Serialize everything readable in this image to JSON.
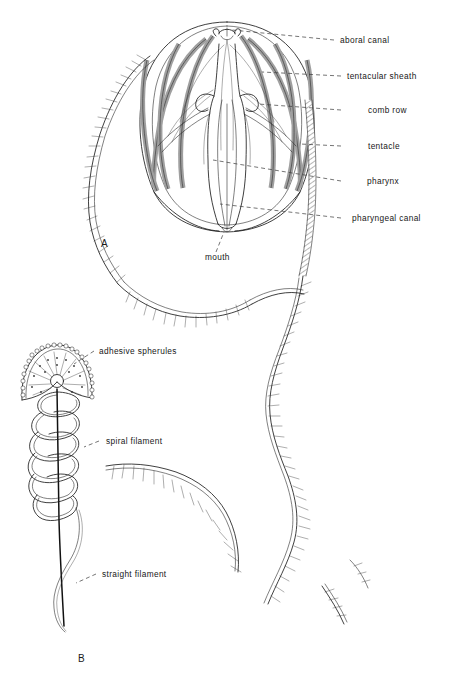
{
  "figure": {
    "background_color": "#ffffff",
    "ink_color": "#1d1d1d"
  },
  "panels": [
    {
      "id": "A",
      "label": "A",
      "caption_x": 101,
      "caption_y": 247
    },
    {
      "id": "B",
      "label": "B",
      "caption_x": 78,
      "caption_y": 662
    }
  ],
  "labels_panel_a": [
    {
      "name": "aboral-canal",
      "text": "aboral canal",
      "x": 340,
      "y": 43,
      "leader_from_x": 334,
      "leader_from_y": 40,
      "leader_to_x": 232,
      "leader_to_y": 30
    },
    {
      "name": "tentacular-sheath",
      "text": "tentacular sheath",
      "x": 347,
      "y": 79,
      "leader_from_x": 341,
      "leader_from_y": 76,
      "leader_to_x": 262,
      "leader_to_y": 72
    },
    {
      "name": "comb-row",
      "text": "comb row",
      "x": 368,
      "y": 113,
      "leader_from_x": 341,
      "leader_from_y": 110,
      "leader_to_x": 258,
      "leader_to_y": 104
    },
    {
      "name": "tentacle",
      "text": "tentacle",
      "x": 368,
      "y": 149,
      "leader_from_x": 341,
      "leader_from_y": 146,
      "leader_to_x": 300,
      "leader_to_y": 144
    },
    {
      "name": "pharynx",
      "text": "pharynx",
      "x": 367,
      "y": 184,
      "leader_from_x": 341,
      "leader_from_y": 181,
      "leader_to_x": 213,
      "leader_to_y": 160
    },
    {
      "name": "pharyngeal-canal",
      "text": "pharyngeal canal",
      "x": 352,
      "y": 221,
      "leader_from_x": 341,
      "leader_from_y": 218,
      "leader_to_x": 220,
      "leader_to_y": 204
    },
    {
      "name": "mouth",
      "text": "mouth",
      "x": 205,
      "y": 260,
      "leader_from_x": 216,
      "leader_from_y": 252,
      "leader_to_x": 224,
      "leader_to_y": 232
    }
  ],
  "labels_panel_b": [
    {
      "name": "adhesive-spherules",
      "text": "adhesive spherules",
      "x": 99,
      "y": 354,
      "leader_from_x": 94,
      "leader_from_y": 351,
      "leader_to_x": 74,
      "leader_to_y": 364
    },
    {
      "name": "spiral-filament",
      "text": "spiral filament",
      "x": 106,
      "y": 444,
      "leader_from_x": 99,
      "leader_from_y": 441,
      "leader_to_x": 84,
      "leader_to_y": 447
    },
    {
      "name": "straight-filament",
      "text": "straight filament",
      "x": 102,
      "y": 577,
      "leader_from_x": 96,
      "leader_from_y": 574,
      "leader_to_x": 76,
      "leader_to_y": 583
    }
  ],
  "structures": {
    "comb_rows_count": 8,
    "spiral_filament_coils": 6,
    "body_outline": "ovoid bell with apical statocyst and elongate pharynx",
    "tentacle_fringe": "fine tentilla along trailing tentacles"
  }
}
